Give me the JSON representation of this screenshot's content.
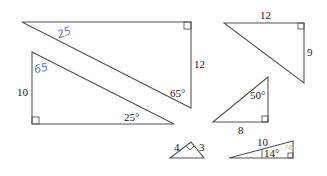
{
  "triangles": [
    {
      "id": "t1",
      "labels": {
        "side_right": "12",
        "angle_bottom": "65°",
        "handwritten_hyp": "25"
      }
    },
    {
      "id": "t2",
      "labels": {
        "side_left": "10",
        "angle_right": "25°",
        "handwritten_top": "65"
      }
    },
    {
      "id": "t3",
      "labels": {
        "side_top": "12",
        "side_right": "9"
      }
    },
    {
      "id": "t4",
      "labels": {
        "angle_top": "50°",
        "side_bottom": "8"
      }
    },
    {
      "id": "t5",
      "labels": {
        "side_left": "4",
        "side_right": "3"
      }
    },
    {
      "id": "t6",
      "labels": {
        "hyp": "10",
        "angle": "14°",
        "handwritten_angle": "76"
      }
    }
  ],
  "colors": {
    "line": "#555555",
    "text": "#222222",
    "pen_blue": "#6b7bbf",
    "pen_yellow": "#d8c27a"
  }
}
